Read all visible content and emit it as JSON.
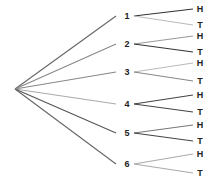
{
  "diagram": {
    "type": "tree",
    "root": {
      "x": 15,
      "y": 89
    },
    "line_colors": {
      "dark": "#555555",
      "mid": "#888888",
      "light": "#bbbbbb"
    },
    "first_level": [
      {
        "label": "1",
        "x": 127,
        "y": 16,
        "edge_color": "#666666",
        "children": [
          {
            "label": "H",
            "x": 200,
            "y": 9,
            "edge_color": "#333333"
          },
          {
            "label": "T",
            "x": 200,
            "y": 25,
            "edge_color": "#bbbbbb"
          }
        ]
      },
      {
        "label": "2",
        "x": 127,
        "y": 44,
        "edge_color": "#888888",
        "children": [
          {
            "label": "H",
            "x": 200,
            "y": 36,
            "edge_color": "#999999"
          },
          {
            "label": "T",
            "x": 200,
            "y": 52,
            "edge_color": "#333333"
          }
        ]
      },
      {
        "label": "3",
        "x": 127,
        "y": 72,
        "edge_color": "#888888",
        "children": [
          {
            "label": "H",
            "x": 200,
            "y": 63,
            "edge_color": "#bbbbbb"
          },
          {
            "label": "T",
            "x": 200,
            "y": 81,
            "edge_color": "#888888"
          }
        ]
      },
      {
        "label": "4",
        "x": 127,
        "y": 104,
        "edge_color": "#aaaaaa",
        "children": [
          {
            "label": "H",
            "x": 200,
            "y": 95,
            "edge_color": "#444444"
          },
          {
            "label": "T",
            "x": 200,
            "y": 112,
            "edge_color": "#444444"
          }
        ]
      },
      {
        "label": "5",
        "x": 127,
        "y": 133,
        "edge_color": "#555555",
        "children": [
          {
            "label": "H",
            "x": 200,
            "y": 125,
            "edge_color": "#777777"
          },
          {
            "label": "T",
            "x": 200,
            "y": 141,
            "edge_color": "#444444"
          }
        ]
      },
      {
        "label": "6",
        "x": 127,
        "y": 164,
        "edge_color": "#666666",
        "children": [
          {
            "label": "H",
            "x": 200,
            "y": 154,
            "edge_color": "#aaaaaa"
          },
          {
            "label": "T",
            "x": 200,
            "y": 173,
            "edge_color": "#aaaaaa"
          }
        ]
      }
    ]
  }
}
